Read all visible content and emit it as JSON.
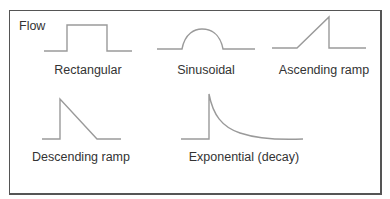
{
  "title": "Flow",
  "waveforms": [
    {
      "id": "rectangular",
      "label": "Rectangular"
    },
    {
      "id": "sinusoidal",
      "label": "Sinusoidal"
    },
    {
      "id": "ascending-ramp",
      "label": "Ascending ramp"
    },
    {
      "id": "descending-ramp",
      "label": "Descending ramp"
    },
    {
      "id": "exponential-decay",
      "label": "Exponential (decay)"
    }
  ],
  "colors": {
    "line": "#9a9a9a",
    "frame": "#555555",
    "text": "#333333"
  }
}
